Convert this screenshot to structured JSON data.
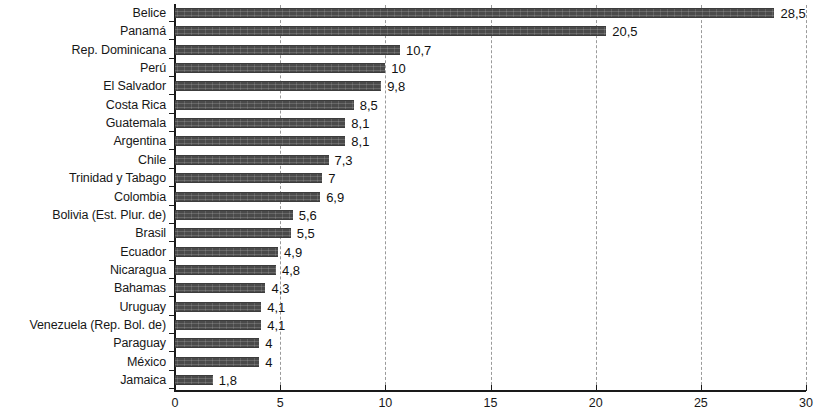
{
  "chart_data": {
    "type": "bar",
    "orientation": "horizontal",
    "title": "",
    "subtitle": "",
    "xlabel": "",
    "ylabel": "",
    "xlim": [
      0,
      30
    ],
    "xticks": [
      "0",
      "5",
      "10",
      "15",
      "20",
      "25",
      "30"
    ],
    "xtick_values": [
      0,
      5,
      10,
      15,
      20,
      25,
      30
    ],
    "grid": "vertical-dashed",
    "legend": "none",
    "decimal_separator": ",",
    "bar_color": "#4a4a4a",
    "axis_color": "#1a1a1a",
    "gridline_color": "#9a9a9a",
    "categories": [
      "Belice",
      "Panamá",
      "Rep. Dominicana",
      "Perú",
      "El Salvador",
      "Costa Rica",
      "Guatemala",
      "Argentina",
      "Chile",
      "Trinidad y Tabago",
      "Colombia",
      "Bolivia (Est. Plur. de)",
      "Brasil",
      "Ecuador",
      "Nicaragua",
      "Bahamas",
      "Uruguay",
      "Venezuela (Rep. Bol. de)",
      "Paraguay",
      "México",
      "Jamaica"
    ],
    "values": [
      28.5,
      20.5,
      10.7,
      10,
      9.8,
      8.5,
      8.1,
      8.1,
      7.3,
      7,
      6.9,
      5.6,
      5.5,
      4.9,
      4.8,
      4.3,
      4.1,
      4.1,
      4,
      4,
      1.8
    ],
    "value_labels": [
      "28,5",
      "20,5",
      "10,7",
      "10",
      "9,8",
      "8,5",
      "8,1",
      "8,1",
      "7,3",
      "7",
      "6,9",
      "5,6",
      "5,5",
      "4,9",
      "4,8",
      "4,3",
      "4,1",
      "4,1",
      "4",
      "4",
      "1,8"
    ]
  }
}
